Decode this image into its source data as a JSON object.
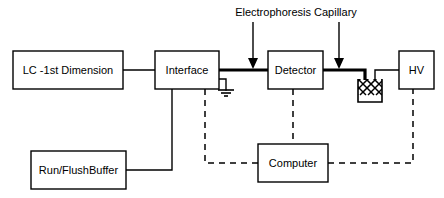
{
  "diagram": {
    "title_annotation": "Electrophoresis Capillary",
    "boxes": {
      "lc": {
        "label": "LC -1st Dimension"
      },
      "interface": {
        "label": "Interface"
      },
      "detector": {
        "label": "Detector"
      },
      "hv": {
        "label": "HV"
      },
      "buffer": {
        "label": "Run/FlushBuffer"
      },
      "computer": {
        "label": "Computer"
      }
    },
    "symbols": {
      "ground": "ground-symbol",
      "vial": "buffer-vial",
      "arrow_left": "capillary-arrow-left",
      "arrow_right": "capillary-arrow-right"
    },
    "colors": {
      "stroke": "#000000",
      "background": "#ffffff"
    }
  }
}
